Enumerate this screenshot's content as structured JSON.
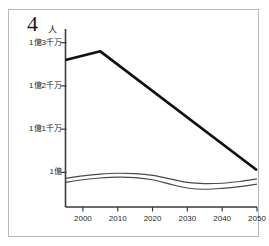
{
  "figure": {
    "number": "4",
    "unit": "人"
  },
  "chart_data": {
    "type": "line",
    "title": "",
    "subtitle": "",
    "xlabel": "",
    "ylabel": "人",
    "grid": false,
    "legend_position": "none",
    "x_tick_labels": [
      "2000",
      "2010",
      "2020",
      "2030",
      "2040",
      "2050"
    ],
    "x_ticks": [
      2000,
      2010,
      2020,
      2030,
      2040,
      2050
    ],
    "xlim": [
      1995,
      2050
    ],
    "y_tick_labels": [
      "1億",
      "1億1千万",
      "1億2千万",
      "1億3千万"
    ],
    "y_ticks": [
      100000000,
      110000000,
      120000000,
      130000000
    ],
    "ylim": [
      92000000,
      132000000
    ],
    "annotations": [],
    "series": [
      {
        "name": "総人口",
        "style": "thick",
        "color": "#111111",
        "x": [
          1995,
          2005,
          2050
        ],
        "values": [
          126000000,
          128000000,
          100500000
        ]
      },
      {
        "name": "推計A",
        "style": "thin",
        "color": "#4a4a4a",
        "x": [
          1995,
          2000,
          2005,
          2010,
          2015,
          2020,
          2025,
          2030,
          2035,
          2040,
          2045,
          2050
        ],
        "values": [
          98600000,
          99200000,
          99600000,
          99800000,
          99700000,
          99300000,
          98500000,
          97700000,
          97400000,
          97500000,
          97900000,
          98500000
        ]
      },
      {
        "name": "推計B",
        "style": "thin",
        "color": "#4a4a4a",
        "x": [
          1995,
          2000,
          2005,
          2010,
          2015,
          2020,
          2025,
          2030,
          2035,
          2040,
          2045,
          2050
        ],
        "values": [
          97700000,
          98300000,
          98700000,
          98900000,
          98800000,
          98300000,
          97300000,
          96400000,
          96100000,
          96300000,
          96700000,
          97300000
        ]
      }
    ]
  }
}
